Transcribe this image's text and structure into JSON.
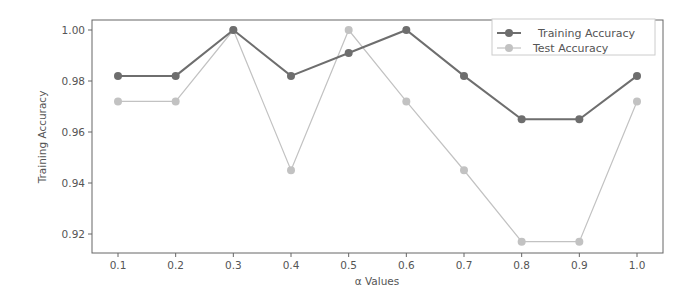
{
  "chart_data": {
    "type": "line",
    "title": "",
    "xlabel": "α Values",
    "ylabel": "Training Accuracy",
    "x": [
      0.1,
      0.2,
      0.3,
      0.4,
      0.5,
      0.6,
      0.7,
      0.8,
      0.9,
      1.0
    ],
    "x_tick_labels": [
      "0.1",
      "0.2",
      "0.3",
      "0.4",
      "0.5",
      "0.6",
      "0.7",
      "0.8",
      "0.9",
      "1.0"
    ],
    "y_tick_values": [
      0.92,
      0.94,
      0.96,
      0.98,
      1.0
    ],
    "y_tick_labels": [
      "0.92",
      "0.94",
      "0.96",
      "0.98",
      "1.00"
    ],
    "ylim": [
      0.913,
      1.004
    ],
    "xlim": [
      0.055,
      1.045
    ],
    "grid": false,
    "legend_position": "upper right",
    "series": [
      {
        "name": "Training Accuracy",
        "color": "#6e6e6e",
        "marker": "circle",
        "values": [
          0.982,
          0.982,
          1.0,
          0.982,
          0.991,
          1.0,
          0.982,
          0.965,
          0.965,
          0.982
        ]
      },
      {
        "name": "Test Accuracy",
        "color": "#c2c2c2",
        "marker": "circle",
        "values": [
          0.972,
          0.972,
          1.0,
          0.945,
          1.0,
          0.972,
          0.945,
          0.917,
          0.917,
          0.972
        ]
      }
    ]
  }
}
